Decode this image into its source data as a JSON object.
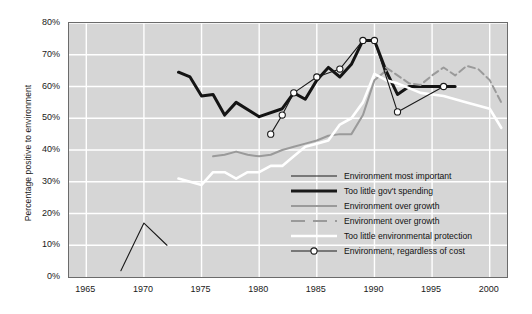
{
  "chart_data": {
    "type": "line",
    "title": "",
    "xlabel": "",
    "ylabel": "Percentage positive to environment",
    "xlim": [
      1963.5,
      2001.5
    ],
    "ylim": [
      0,
      80
    ],
    "grid": true,
    "legend_position": "inside-bottom-right",
    "xticks": [
      "1965",
      "1970",
      "1975",
      "1980",
      "1985",
      "1990",
      "1995",
      "2000"
    ],
    "xtick_values": [
      1965,
      1970,
      1975,
      1980,
      1985,
      1990,
      1995,
      2000
    ],
    "yticks": [
      "0%",
      "10%",
      "20%",
      "30%",
      "40%",
      "50%",
      "60%",
      "70%",
      "80%"
    ],
    "ytick_values": [
      0,
      10,
      20,
      30,
      40,
      50,
      60,
      70,
      80
    ],
    "series": [
      {
        "name": "Environment most important",
        "style": "thin-solid",
        "color": "#1a1a1a",
        "width": 1.1,
        "markers": false,
        "x": [
          1968,
          1970,
          1972
        ],
        "y": [
          2,
          17,
          10
        ]
      },
      {
        "name": "Too little gov't spending",
        "style": "thick-solid",
        "color": "#141414",
        "width": 3.0,
        "markers": false,
        "x": [
          1973,
          1974,
          1975,
          1976,
          1977,
          1978,
          1980,
          1982,
          1983,
          1984,
          1985,
          1986,
          1987,
          1988,
          1989,
          1990,
          1991,
          1992,
          1993,
          1994,
          1996,
          1997
        ],
        "y": [
          64.5,
          63,
          57,
          57.5,
          51,
          55,
          50.5,
          53,
          58,
          56,
          62,
          66,
          63,
          67,
          74.5,
          74.5,
          65,
          57.5,
          60,
          60,
          60,
          60
        ]
      },
      {
        "name": "Environment over growth",
        "style": "gray-solid",
        "color": "#9a9a9a",
        "width": 2.0,
        "markers": false,
        "x": [
          1976,
          1977,
          1978,
          1979,
          1980,
          1981,
          1982,
          1983,
          1984,
          1985,
          1986,
          1987,
          1988,
          1989,
          1990,
          1991
        ],
        "y": [
          38,
          38.5,
          39.5,
          38.5,
          38,
          38.5,
          40,
          41,
          42,
          43,
          44.5,
          45,
          45,
          51,
          62,
          65
        ]
      },
      {
        "name": "Environment over growth",
        "style": "gray-dashed",
        "color": "#9a9a9a",
        "width": 2.0,
        "markers": false,
        "x": [
          1991,
          1992,
          1993,
          1994,
          1995,
          1996,
          1997,
          1998,
          1999,
          2000,
          2001
        ],
        "y": [
          66,
          63.5,
          61,
          60.5,
          63.5,
          66,
          63.5,
          66.5,
          65.5,
          62,
          55
        ]
      },
      {
        "name": "Too little environmental protection",
        "style": "white-solid",
        "color": "#ffffff",
        "width": 2.6,
        "markers": false,
        "x": [
          1973,
          1974,
          1975,
          1976,
          1977,
          1978,
          1979,
          1980,
          1981,
          1982,
          1983,
          1984,
          1985,
          1986,
          1987,
          1988,
          1989,
          1990,
          1991,
          1992,
          1994,
          1996,
          1998,
          2000,
          2001
        ],
        "y": [
          31,
          30,
          29,
          33,
          33,
          31,
          33,
          33,
          35,
          35,
          38,
          41,
          42,
          43,
          48,
          50,
          55,
          64,
          62,
          61,
          58,
          57,
          55,
          53,
          47
        ]
      },
      {
        "name": "Environment, regardless of cost",
        "style": "thin-solid-markers",
        "color": "#1a1a1a",
        "width": 1.1,
        "markers": true,
        "x": [
          1981,
          1982,
          1983,
          1985,
          1987,
          1989,
          1990,
          1992,
          1996
        ],
        "y": [
          45,
          51,
          58,
          63,
          65.5,
          74.5,
          74.5,
          52,
          60
        ]
      }
    ]
  },
  "legend": {
    "items": [
      {
        "label": "Environment most important",
        "style": "thin-solid"
      },
      {
        "label": "Too little gov't spending",
        "style": "thick-solid"
      },
      {
        "label": "Environment over growth",
        "style": "gray-solid"
      },
      {
        "label": "Environment over growth",
        "style": "gray-dashed"
      },
      {
        "label": "Too little environmental protection",
        "style": "white-solid"
      },
      {
        "label": "Environment, regardless of cost",
        "style": "thin-solid-markers"
      }
    ]
  },
  "colors": {
    "plot_background": "#d6d6d6",
    "gridline": "#ffffff",
    "axis": "#6b6b6b",
    "black_series": "#1a1a1a",
    "gray_series": "#9a9a9a",
    "white_series": "#ffffff"
  }
}
